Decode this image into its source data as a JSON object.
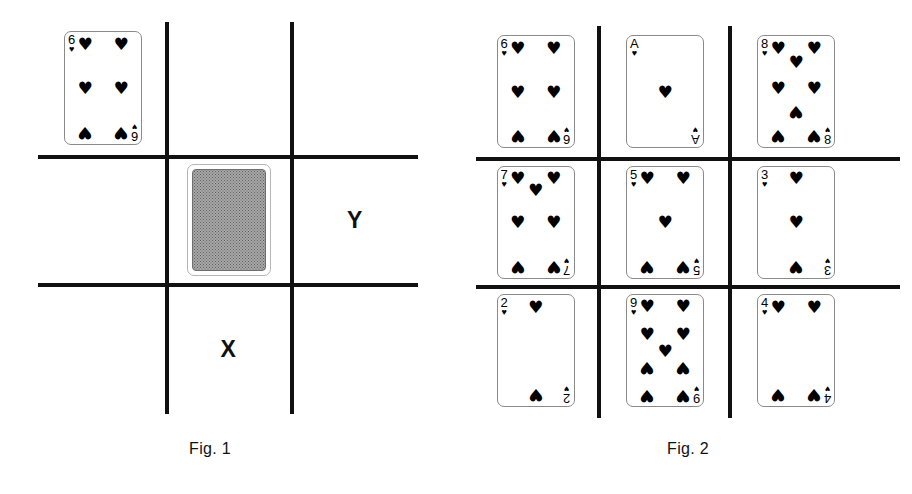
{
  "page": {
    "background": "#ffffff",
    "ink": "#111111"
  },
  "figures": [
    {
      "id": "fig1",
      "caption": "Fig. 1",
      "grid": {
        "rows": 3,
        "cols": 3,
        "line_color": "#111111"
      },
      "cells": [
        {
          "row": 0,
          "col": 0,
          "content": "card",
          "card": {
            "rank": "6",
            "suit": "hearts",
            "suit_glyph": "♥",
            "pip_count": 6,
            "face": "up"
          }
        },
        {
          "row": 0,
          "col": 1,
          "content": "empty",
          "label": ""
        },
        {
          "row": 0,
          "col": 2,
          "content": "empty",
          "label": ""
        },
        {
          "row": 1,
          "col": 0,
          "content": "empty",
          "label": ""
        },
        {
          "row": 1,
          "col": 1,
          "content": "card-back",
          "card": {
            "face": "down",
            "back_color": "#a8a8a8"
          }
        },
        {
          "row": 1,
          "col": 2,
          "content": "label",
          "label": "Y"
        },
        {
          "row": 2,
          "col": 0,
          "content": "empty",
          "label": ""
        },
        {
          "row": 2,
          "col": 1,
          "content": "label",
          "label": "X"
        },
        {
          "row": 2,
          "col": 2,
          "content": "empty",
          "label": ""
        }
      ]
    },
    {
      "id": "fig2",
      "caption": "Fig. 2",
      "grid": {
        "rows": 3,
        "cols": 3,
        "line_color": "#111111"
      },
      "cells": [
        {
          "row": 0,
          "col": 0,
          "content": "card",
          "card": {
            "rank": "6",
            "suit": "hearts",
            "suit_glyph": "♥",
            "pip_count": 6,
            "face": "up"
          }
        },
        {
          "row": 0,
          "col": 1,
          "content": "card",
          "card": {
            "rank": "A",
            "suit": "hearts",
            "suit_glyph": "♥",
            "pip_count": 1,
            "face": "up"
          }
        },
        {
          "row": 0,
          "col": 2,
          "content": "card",
          "card": {
            "rank": "8",
            "suit": "hearts",
            "suit_glyph": "♥",
            "pip_count": 8,
            "face": "up"
          }
        },
        {
          "row": 1,
          "col": 0,
          "content": "card",
          "card": {
            "rank": "7",
            "suit": "hearts",
            "suit_glyph": "♥",
            "pip_count": 7,
            "face": "up"
          }
        },
        {
          "row": 1,
          "col": 1,
          "content": "card",
          "card": {
            "rank": "5",
            "suit": "hearts",
            "suit_glyph": "♥",
            "pip_count": 5,
            "face": "up"
          }
        },
        {
          "row": 1,
          "col": 2,
          "content": "card",
          "card": {
            "rank": "3",
            "suit": "hearts",
            "suit_glyph": "♥",
            "pip_count": 3,
            "face": "up"
          }
        },
        {
          "row": 2,
          "col": 0,
          "content": "card",
          "card": {
            "rank": "2",
            "suit": "hearts",
            "suit_glyph": "♥",
            "pip_count": 2,
            "face": "up"
          }
        },
        {
          "row": 2,
          "col": 1,
          "content": "card",
          "card": {
            "rank": "9",
            "suit": "hearts",
            "suit_glyph": "♥",
            "pip_count": 9,
            "face": "up"
          }
        },
        {
          "row": 2,
          "col": 2,
          "content": "card",
          "card": {
            "rank": "4",
            "suit": "hearts",
            "suit_glyph": "♥",
            "pip_count": 4,
            "face": "up"
          }
        }
      ]
    }
  ]
}
